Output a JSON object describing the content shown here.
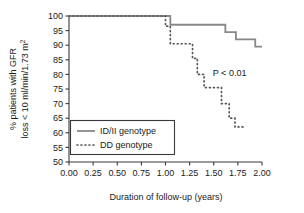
{
  "chart_data": {
    "type": "line",
    "title": "",
    "subtitle": "",
    "xlabel": "Duration of follow-up (years)",
    "ylabel": "% patients with GFR loss < 10 ml/min/1.73 m²",
    "ylabel_line1": "% patients with GFR",
    "ylabel_line2": "loss < 10 ml/min/1.73 m",
    "ylabel_line2_sup": "2",
    "xlim": [
      0.0,
      2.0
    ],
    "ylim": [
      50,
      100
    ],
    "xticks": [
      0.0,
      0.25,
      0.5,
      0.75,
      1.0,
      1.25,
      1.5,
      1.75,
      2.0
    ],
    "xtick_labels": [
      "0.00",
      "0.25",
      "0.50",
      "0.75",
      "1.00",
      "1.25",
      "1.50",
      "1.75",
      "2.00"
    ],
    "yticks": [
      50,
      55,
      60,
      65,
      70,
      75,
      80,
      85,
      90,
      95,
      100
    ],
    "ytick_labels": [
      "50",
      "55",
      "60",
      "65",
      "70",
      "75",
      "80",
      "85",
      "90",
      "95",
      "100"
    ],
    "grid": false,
    "legend_position": "lower-left",
    "annotations": [
      {
        "name": "p-value",
        "text": "P < 0.01",
        "x": 1.49,
        "y": 79.5
      }
    ],
    "series": [
      {
        "name": "ID/II genotype",
        "style": "solid",
        "color": "#888888",
        "step": "post",
        "points": [
          {
            "x": 0.0,
            "y": 100.0
          },
          {
            "x": 1.05,
            "y": 100.0
          },
          {
            "x": 1.05,
            "y": 97.0
          },
          {
            "x": 1.62,
            "y": 97.0
          },
          {
            "x": 1.62,
            "y": 94.5
          },
          {
            "x": 1.73,
            "y": 94.5
          },
          {
            "x": 1.73,
            "y": 92.0
          },
          {
            "x": 1.93,
            "y": 92.0
          },
          {
            "x": 1.93,
            "y": 89.5
          },
          {
            "x": 2.0,
            "y": 89.5
          }
        ]
      },
      {
        "name": "DD genotype",
        "style": "dotted",
        "color": "#555555",
        "step": "post",
        "points": [
          {
            "x": 0.0,
            "y": 100.0
          },
          {
            "x": 1.0,
            "y": 100.0
          },
          {
            "x": 1.0,
            "y": 96.5
          },
          {
            "x": 1.05,
            "y": 96.5
          },
          {
            "x": 1.05,
            "y": 90.5
          },
          {
            "x": 1.28,
            "y": 90.5
          },
          {
            "x": 1.28,
            "y": 85.5
          },
          {
            "x": 1.33,
            "y": 85.5
          },
          {
            "x": 1.33,
            "y": 80.0
          },
          {
            "x": 1.4,
            "y": 80.0
          },
          {
            "x": 1.4,
            "y": 75.5
          },
          {
            "x": 1.58,
            "y": 75.5
          },
          {
            "x": 1.58,
            "y": 70.0
          },
          {
            "x": 1.66,
            "y": 70.0
          },
          {
            "x": 1.66,
            "y": 65.0
          },
          {
            "x": 1.72,
            "y": 65.0
          },
          {
            "x": 1.72,
            "y": 62.0
          },
          {
            "x": 1.82,
            "y": 62.0
          }
        ]
      }
    ]
  },
  "legend": {
    "items": [
      {
        "label": "ID/II genotype",
        "style": "solid"
      },
      {
        "label": "DD genotype",
        "style": "dotted"
      }
    ]
  }
}
